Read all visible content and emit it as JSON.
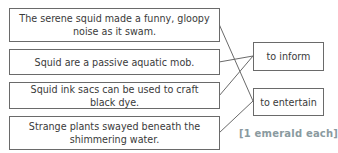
{
  "statements": [
    {
      "text": "The serene squid made a funny, gloopy noise as it swam."
    },
    {
      "text": "Squid are a passive aquatic mob."
    },
    {
      "text": "Squid ink sacs can be used to craft black dye."
    },
    {
      "text": "Strange plants swayed beneath the shimmering water."
    }
  ],
  "purposes": [
    {
      "text": "to inform"
    },
    {
      "text": "to entertain"
    }
  ],
  "matches": [
    {
      "statement": 0,
      "purpose": "to entertain"
    },
    {
      "statement": 1,
      "purpose": "to inform"
    },
    {
      "statement": 2,
      "purpose": "to inform"
    },
    {
      "statement": 3,
      "purpose": "to entertain"
    }
  ],
  "marks": "[1 emerald each]",
  "colors": {
    "border": "#6a6a6a",
    "text": "#3a3a3a",
    "marks": "#8a9aa0"
  }
}
